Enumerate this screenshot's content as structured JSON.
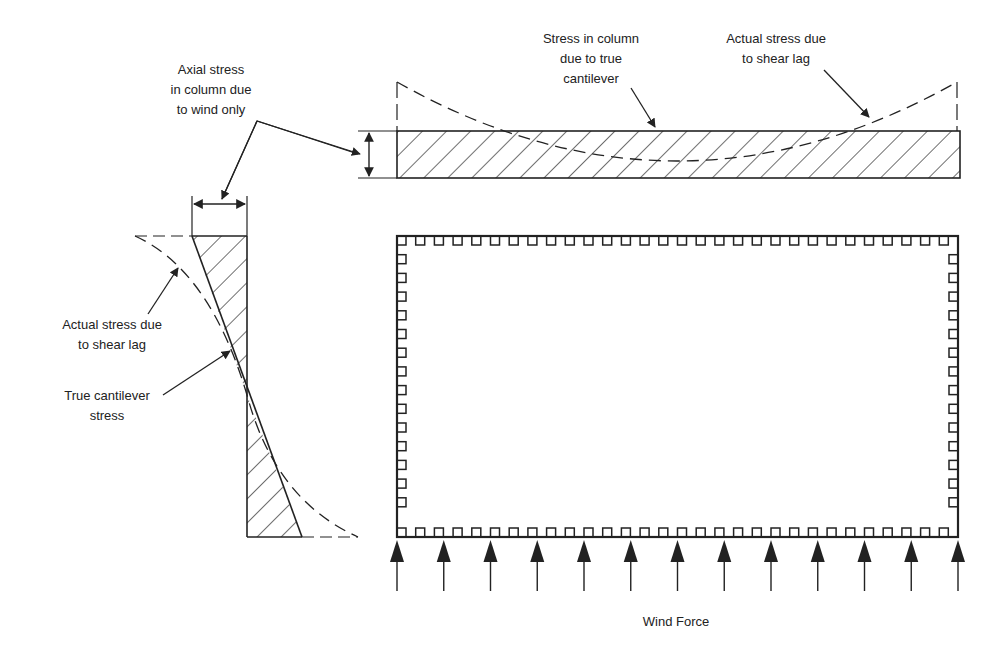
{
  "diagram": {
    "labels": {
      "axial_stress": [
        "Axial stress",
        "in column due",
        "to wind only"
      ],
      "stress_true_cantilever": [
        "Stress in column",
        "due to true",
        "cantilever"
      ],
      "actual_stress_top": [
        "Actual stress due",
        "to shear lag"
      ],
      "actual_stress_left": [
        "Actual stress due",
        "to shear lag"
      ],
      "true_cantilever_stress": [
        "True cantilever",
        "stress"
      ],
      "wind_force": "Wind Force"
    },
    "wind_arrow_count": 13,
    "colors": {
      "line": "#222222",
      "background": "#ffffff"
    }
  }
}
